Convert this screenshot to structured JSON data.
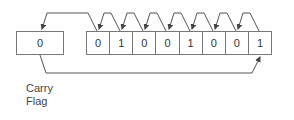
{
  "diagram": {
    "carry_flag": {
      "value": "0",
      "label_line1": "Carry",
      "label_line2": "Flag"
    },
    "register": {
      "bits": [
        "0",
        "1",
        "0",
        "0",
        "1",
        "0",
        "0",
        "1"
      ]
    },
    "arrows": [
      "register bit 0 (leftmost) to carry flag",
      "each bit shifts one position left",
      "carry flag to register bit 7 (rightmost)"
    ],
    "colors": {
      "line": "#555555",
      "box_border": "#777777",
      "text": "#333333"
    }
  }
}
